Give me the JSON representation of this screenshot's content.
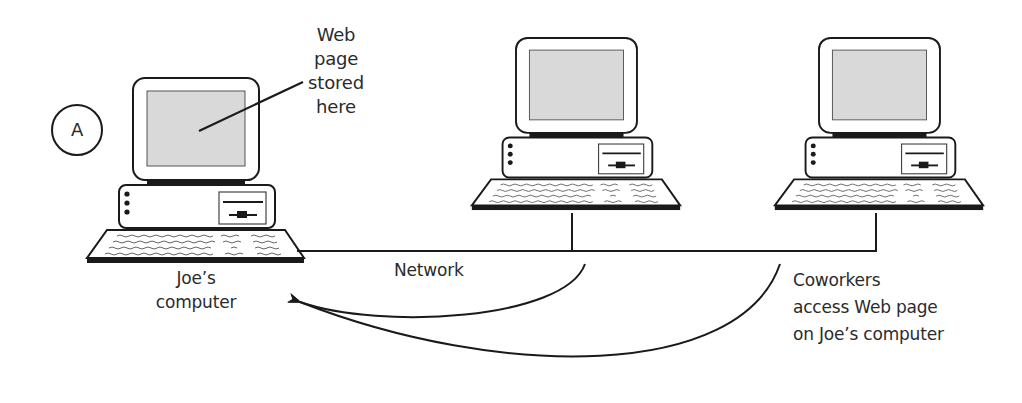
{
  "diagram": {
    "marker": {
      "label": "A"
    },
    "nodes": [
      {
        "id": "joe",
        "label_lines": [
          "Joe’s",
          "computer"
        ]
      },
      {
        "id": "coworker-1",
        "label_lines": []
      },
      {
        "id": "coworker-2",
        "label_lines": []
      }
    ],
    "callout": {
      "lines": [
        "Web",
        "page",
        "stored",
        "here"
      ]
    },
    "network": {
      "label": "Network"
    },
    "caption": {
      "lines": [
        "Coworkers",
        "access Web page",
        "on Joe’s computer"
      ]
    },
    "colors": {
      "stroke": "#1a1a1a",
      "screen": "#d9d9d9",
      "text": "#2b2b2b",
      "background": "#ffffff"
    }
  }
}
